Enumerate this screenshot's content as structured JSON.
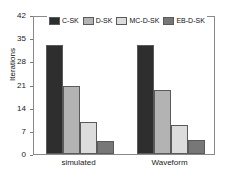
{
  "chart_data": {
    "type": "bar",
    "title": "",
    "xlabel": "",
    "ylabel": "Iterations",
    "categories": [
      "simulated",
      "Waveform"
    ],
    "series": [
      {
        "name": "C-SK",
        "color": "#2e2e2e",
        "values": [
          33,
          33
        ]
      },
      {
        "name": "D-SK",
        "color": "#b3b3b3",
        "values": [
          20.5,
          19.3
        ]
      },
      {
        "name": "MC-D-SK",
        "color": "#dcdcdc",
        "values": [
          9.7,
          8.8
        ]
      },
      {
        "name": "EB-D-SK",
        "color": "#777777",
        "values": [
          3.9,
          4.2
        ]
      }
    ],
    "ylim": [
      0,
      42
    ],
    "yticks": [
      0,
      7,
      14,
      21,
      28,
      35,
      42
    ],
    "ytick_labels": [
      "0",
      "7",
      "14",
      "21",
      "28",
      "35",
      "42"
    ],
    "grid": false,
    "legend_position": "top-center",
    "axis_color": "#8a8a8a",
    "background": "#ffffff"
  }
}
